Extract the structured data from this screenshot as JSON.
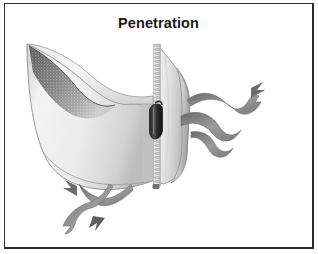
{
  "figure": {
    "title": "Penetration",
    "background_color": "#ffffff",
    "border_color": "#2b2b2b",
    "title_color": "#1a1a1a"
  },
  "illustration": {
    "name": "unzipping-membrane-illustration",
    "description": "Grayscale drawing of a membrane barrier split open by a vertical zipper, with ribbon tendrils",
    "palette": {
      "flap_light": "#f2f2f2",
      "flap_mid": "#d8d8d8",
      "flap_shadow": "#a9a9a9",
      "crescent_dark": "#6e6e6e",
      "tendril_gray": "#8a8a8a",
      "tendril_dark": "#5e5e5e",
      "zipper_teeth": "#9b9b9b",
      "zipper_slider": "#3a3a3a",
      "outline": "#7a7a7a"
    },
    "parts": [
      {
        "name": "left-flap",
        "label": "Left membrane flap"
      },
      {
        "name": "right-flap",
        "label": "Right membrane flap"
      },
      {
        "name": "zipper-track",
        "label": "Zipper track"
      },
      {
        "name": "zipper-slider",
        "label": "Zipper slider"
      },
      {
        "name": "crescent-fold",
        "label": "Upper-left folded edge"
      },
      {
        "name": "right-tendrils",
        "label": "Right ribbon tendrils"
      },
      {
        "name": "lower-tendrils",
        "label": "Lower ribbon tendrils"
      }
    ]
  }
}
